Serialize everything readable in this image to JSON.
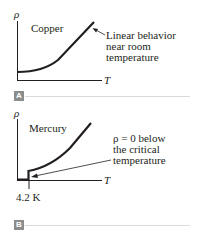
{
  "panels": [
    {
      "id": "A",
      "badge": "A",
      "y_axis_label": "ρ",
      "x_axis_label": "T",
      "material": "Copper",
      "annotation_lines": [
        "Linear behavior",
        "near room",
        "temperature"
      ]
    },
    {
      "id": "B",
      "badge": "B",
      "y_axis_label": "ρ",
      "x_axis_label": "T",
      "material": "Mercury",
      "annotation_lines": [
        "ρ = 0 below",
        "the critical",
        "temperature"
      ],
      "tick_label": "4.2 K"
    }
  ],
  "colors": {
    "ink": "#231f20",
    "badge": "#8a8c8e",
    "separator": "#d9dadb"
  }
}
